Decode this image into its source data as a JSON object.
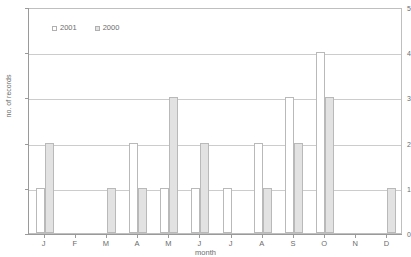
{
  "chart_data": {
    "type": "bar",
    "title": "",
    "xlabel": "month",
    "ylabel": "no. of records",
    "ylim": [
      0,
      5
    ],
    "yticks": [
      0,
      1,
      2,
      3,
      4,
      5
    ],
    "grid": true,
    "legend_position": "top-left",
    "categories": [
      "J",
      "F",
      "M",
      "A",
      "M",
      "J",
      "J",
      "A",
      "S",
      "O",
      "N",
      "D"
    ],
    "category_names": [
      "January",
      "February",
      "March",
      "April",
      "May",
      "June",
      "July",
      "August",
      "September",
      "October",
      "November",
      "December"
    ],
    "series": [
      {
        "name": "2001",
        "color": "#ffffff",
        "values": [
          1,
          0,
          0,
          2,
          1,
          1,
          1,
          2,
          3,
          4,
          0,
          0
        ]
      },
      {
        "name": "2000",
        "color": "#e2e2e2",
        "values": [
          2,
          0,
          1,
          1,
          3,
          2,
          0,
          1,
          2,
          3,
          0,
          1
        ]
      }
    ]
  },
  "axes": {
    "y_title": "no. of records",
    "x_title": "month",
    "y_tick_labels": [
      "5",
      "4",
      "3",
      "2",
      "1",
      "0"
    ],
    "x_tick_labels": [
      "J",
      "F",
      "M",
      "A",
      "M",
      "J",
      "J",
      "A",
      "S",
      "O",
      "N",
      "D"
    ]
  },
  "legend": {
    "entries": [
      {
        "label": "2001",
        "swatch": "white-square-swatch"
      },
      {
        "label": "2000",
        "swatch": "gray-square-swatch"
      }
    ]
  },
  "title_strip": {
    "text": ""
  }
}
